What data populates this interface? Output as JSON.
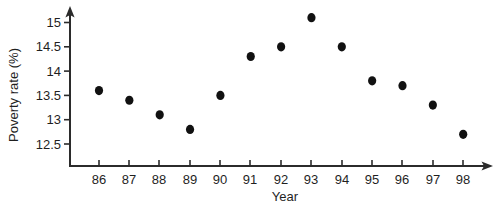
{
  "chart_data": {
    "type": "scatter",
    "title": "",
    "xlabel": "Year",
    "ylabel": "Poverty rate (%)",
    "categories": [
      "86",
      "87",
      "88",
      "89",
      "90",
      "91",
      "92",
      "93",
      "94",
      "95",
      "96",
      "97",
      "98"
    ],
    "x": [
      86,
      87,
      88,
      89,
      90,
      91,
      92,
      93,
      94,
      95,
      96,
      97,
      98
    ],
    "values": [
      13.6,
      13.4,
      13.1,
      12.8,
      13.5,
      14.3,
      14.5,
      15.1,
      14.5,
      13.8,
      13.7,
      13.3,
      12.7
    ],
    "series": [
      {
        "name": "Poverty rate",
        "values": [
          13.6,
          13.4,
          13.1,
          12.8,
          13.5,
          14.3,
          14.5,
          15.1,
          14.5,
          13.8,
          13.7,
          13.3,
          12.7
        ]
      }
    ],
    "points": [
      {
        "x": "86",
        "y": 13.6
      },
      {
        "x": "87",
        "y": 13.4
      },
      {
        "x": "88",
        "y": 13.1
      },
      {
        "x": "89",
        "y": 12.8
      },
      {
        "x": "90",
        "y": 13.5
      },
      {
        "x": "91",
        "y": 14.3
      },
      {
        "x": "92",
        "y": 14.5
      },
      {
        "x": "93",
        "y": 15.1
      },
      {
        "x": "94",
        "y": 14.5
      },
      {
        "x": "95",
        "y": 13.8
      },
      {
        "x": "96",
        "y": 13.7
      },
      {
        "x": "97",
        "y": 13.3
      },
      {
        "x": "98",
        "y": 12.7
      }
    ],
    "y_ticks": [
      "15",
      "14.5",
      "14",
      "13.5",
      "13",
      "12.5"
    ],
    "y_tick_values": [
      15,
      14.5,
      14,
      13.5,
      13,
      12.5
    ],
    "ylim": [
      12.25,
      15.3
    ],
    "xlim": [
      85.3,
      98.9
    ],
    "grid": false,
    "legend": false,
    "legend_position": "none",
    "marker": "filled-circle",
    "marker_color": "#111111",
    "axis_color": "#2b2b2b",
    "background_color": "#ffffff",
    "axis_style": "arrow-tipped-L"
  },
  "labels": {
    "y_axis_title": "Poverty rate (%)",
    "x_axis_title": "Year"
  }
}
